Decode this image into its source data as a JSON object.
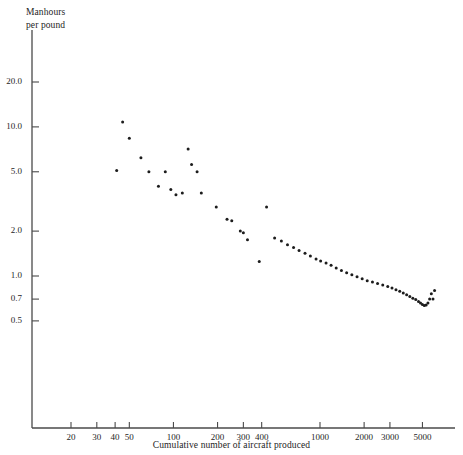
{
  "chart_data": {
    "type": "scatter",
    "title": "",
    "xlabel": "Cumulative number of aircraft produced",
    "ylabel": "Manhours per pound",
    "ylabel_lines": [
      "Manhours",
      "per pound"
    ],
    "xscale": "log",
    "yscale": "log",
    "grid": false,
    "legend": null,
    "xlim": [
      15,
      7000
    ],
    "ylim": [
      0.45,
      30
    ],
    "xticks": [
      20,
      30,
      40,
      50,
      100,
      200,
      300,
      400,
      1000,
      2000,
      3000,
      5000
    ],
    "xticklabels": [
      "20",
      "30",
      "40",
      "50",
      "100",
      "200",
      "300",
      "400",
      "1000",
      "2000",
      "3000",
      "5000"
    ],
    "yticks": [
      20.0,
      10.0,
      5.0,
      2.0,
      1.0,
      0.7,
      0.5
    ],
    "yticklabels": [
      "20.0",
      "10.0",
      "5.0",
      "2.0",
      "1.0",
      "0.7",
      "0.5"
    ],
    "marker": "filled-circle",
    "marker_color": "#1c1c1c",
    "marker_size": 3.0,
    "points": [
      [
        45,
        10.8
      ],
      [
        50,
        8.4
      ],
      [
        60,
        6.2
      ],
      [
        41,
        5.1
      ],
      [
        68,
        5.0
      ],
      [
        88,
        5.0
      ],
      [
        79,
        4.0
      ],
      [
        96,
        3.8
      ],
      [
        104,
        3.5
      ],
      [
        126,
        7.1
      ],
      [
        133,
        5.6
      ],
      [
        145,
        5.0
      ],
      [
        115,
        3.6
      ],
      [
        155,
        3.6
      ],
      [
        196,
        2.9
      ],
      [
        232,
        2.4
      ],
      [
        250,
        2.35
      ],
      [
        286,
        2.0
      ],
      [
        300,
        1.95
      ],
      [
        320,
        1.75
      ],
      [
        432,
        2.9
      ],
      [
        385,
        1.25
      ],
      [
        490,
        1.8
      ],
      [
        545,
        1.72
      ],
      [
        600,
        1.62
      ],
      [
        660,
        1.55
      ],
      [
        720,
        1.48
      ],
      [
        790,
        1.42
      ],
      [
        860,
        1.36
      ],
      [
        940,
        1.3
      ],
      [
        1010,
        1.26
      ],
      [
        1100,
        1.22
      ],
      [
        1190,
        1.18
      ],
      [
        1290,
        1.13
      ],
      [
        1400,
        1.09
      ],
      [
        1520,
        1.05
      ],
      [
        1650,
        1.02
      ],
      [
        1790,
        0.99
      ],
      [
        1940,
        0.96
      ],
      [
        2100,
        0.93
      ],
      [
        2280,
        0.91
      ],
      [
        2470,
        0.89
      ],
      [
        2680,
        0.87
      ],
      [
        2900,
        0.85
      ],
      [
        3100,
        0.83
      ],
      [
        3300,
        0.81
      ],
      [
        3500,
        0.79
      ],
      [
        3700,
        0.77
      ],
      [
        3900,
        0.75
      ],
      [
        4100,
        0.73
      ],
      [
        4300,
        0.71
      ],
      [
        4500,
        0.695
      ],
      [
        4700,
        0.675
      ],
      [
        4850,
        0.66
      ],
      [
        5000,
        0.645
      ],
      [
        5150,
        0.635
      ],
      [
        5300,
        0.64
      ],
      [
        5450,
        0.66
      ],
      [
        5600,
        0.7
      ],
      [
        5750,
        0.76
      ],
      [
        5900,
        0.7
      ],
      [
        6050,
        0.8
      ]
    ]
  },
  "axes": {
    "axis_color": "#4a4a4a",
    "tick_color": "#4a4a4a"
  },
  "ghost_text": ""
}
